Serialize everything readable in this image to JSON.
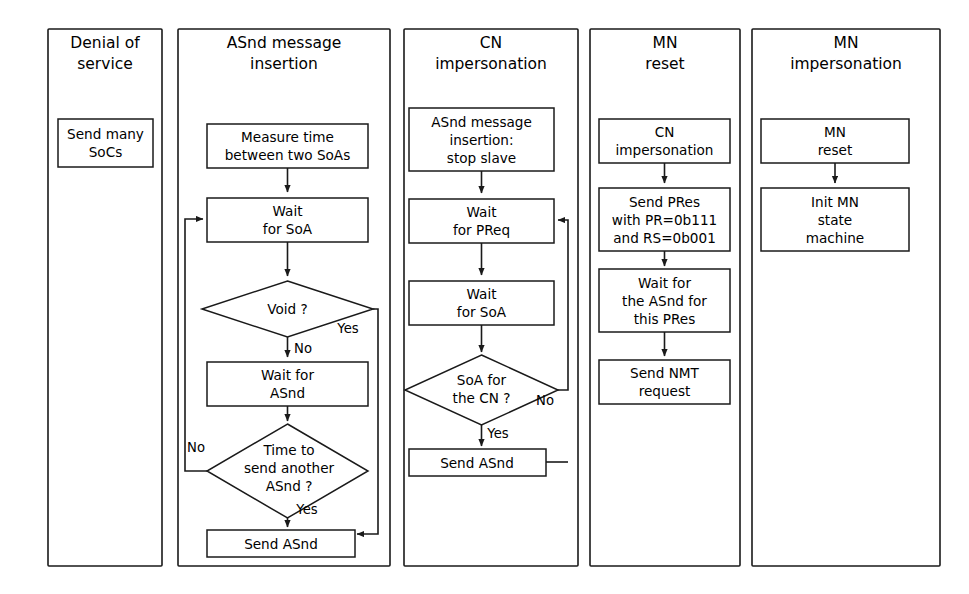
{
  "figure": {
    "kind": "flowchart",
    "background_color": "#ffffff",
    "line_color": "#1a1a1a",
    "text_color": "#000000"
  },
  "panels": [
    {
      "id": "denial-of-service",
      "title_lines": [
        "Denial of",
        "service"
      ],
      "nodes": [
        {
          "id": "send-many-socs",
          "shape": "rect",
          "lines": [
            "Send many",
            "SoCs"
          ]
        }
      ],
      "edge_labels": []
    },
    {
      "id": "asnd-message-insertion",
      "title_lines": [
        "ASnd message",
        "insertion"
      ],
      "nodes": [
        {
          "id": "measure-time",
          "shape": "rect",
          "lines": [
            "Measure time",
            "between two SoAs"
          ]
        },
        {
          "id": "wait-for-soa",
          "shape": "rect",
          "lines": [
            "Wait",
            "for SoA"
          ]
        },
        {
          "id": "void-decision",
          "shape": "diamond",
          "lines": [
            "Void ?"
          ]
        },
        {
          "id": "wait-for-asnd",
          "shape": "rect",
          "lines": [
            "Wait for",
            "ASnd"
          ]
        },
        {
          "id": "time-to-send-decision",
          "shape": "diamond",
          "lines": [
            "Time to",
            "send another",
            "ASnd ?"
          ]
        },
        {
          "id": "send-asnd",
          "shape": "rect",
          "lines": [
            "Send ASnd"
          ]
        }
      ],
      "edge_labels": [
        {
          "id": "void-yes",
          "text": "Yes"
        },
        {
          "id": "void-no",
          "text": "No"
        },
        {
          "id": "time-no",
          "text": "No"
        },
        {
          "id": "time-yes",
          "text": "Yes"
        }
      ]
    },
    {
      "id": "cn-impersonation",
      "title_lines": [
        "CN",
        "impersonation"
      ],
      "nodes": [
        {
          "id": "asnd-stop-slave",
          "shape": "rect",
          "lines": [
            "ASnd message",
            "insertion:",
            "stop slave"
          ]
        },
        {
          "id": "wait-for-preq",
          "shape": "rect",
          "lines": [
            "Wait",
            "for PReq"
          ]
        },
        {
          "id": "wait-for-soa-cn",
          "shape": "rect",
          "lines": [
            "Wait",
            "for SoA"
          ]
        },
        {
          "id": "soa-for-cn-decision",
          "shape": "diamond",
          "lines": [
            "SoA for",
            "the CN ?"
          ]
        },
        {
          "id": "send-asnd-cn",
          "shape": "rect",
          "lines": [
            "Send ASnd"
          ]
        }
      ],
      "edge_labels": [
        {
          "id": "soa-cn-no",
          "text": "No"
        },
        {
          "id": "soa-cn-yes",
          "text": "Yes"
        }
      ]
    },
    {
      "id": "mn-reset",
      "title_lines": [
        "MN",
        "reset"
      ],
      "nodes": [
        {
          "id": "cn-impersonation-step",
          "shape": "rect",
          "lines": [
            "CN",
            "impersonation"
          ]
        },
        {
          "id": "send-pres",
          "shape": "rect",
          "lines": [
            "Send PRes",
            "with PR=0b111",
            "and RS=0b001"
          ]
        },
        {
          "id": "wait-asnd-pres",
          "shape": "rect",
          "lines": [
            "Wait for",
            "the ASnd for",
            "this PRes"
          ]
        },
        {
          "id": "send-nmt-request",
          "shape": "rect",
          "lines": [
            "Send NMT",
            "request"
          ]
        }
      ],
      "edge_labels": []
    },
    {
      "id": "mn-impersonation",
      "title_lines": [
        "MN",
        "impersonation"
      ],
      "nodes": [
        {
          "id": "mn-reset-step",
          "shape": "rect",
          "lines": [
            "MN",
            "reset"
          ]
        },
        {
          "id": "init-mn-state-machine",
          "shape": "rect",
          "lines": [
            "Init MN",
            "state",
            "machine"
          ]
        }
      ],
      "edge_labels": []
    }
  ]
}
